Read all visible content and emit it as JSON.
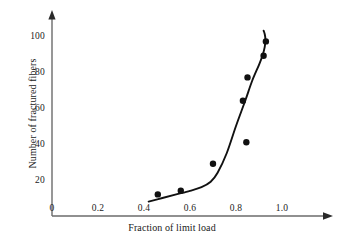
{
  "chart_data": {
    "type": "scatter",
    "title": "",
    "subtitle": "",
    "xlabel": "Fraction of limit load",
    "ylabel": "Number of fractured fibers",
    "xlim": [
      0,
      1.08
    ],
    "ylim": [
      0,
      108
    ],
    "xticks": [
      "0",
      "0.2",
      "0.4",
      "0.6",
      "0.8",
      "1.0"
    ],
    "xtick_values": [
      0,
      0.2,
      0.4,
      0.6,
      0.8,
      1.0
    ],
    "yticks": [
      "20",
      "40",
      "60",
      "80",
      "100"
    ],
    "ytick_values": [
      20,
      40,
      60,
      80,
      100
    ],
    "grid": false,
    "legend": null,
    "axis_style": "arrow-tipped L-axes, no tick marks",
    "marker_style": "filled black circle",
    "marker_color": "#111111",
    "line_color": "#111111",
    "axis_color": "#6b6b6b",
    "points": [
      {
        "x": 0.46,
        "y": 12
      },
      {
        "x": 0.56,
        "y": 14
      },
      {
        "x": 0.7,
        "y": 29
      },
      {
        "x": 0.83,
        "y": 64
      },
      {
        "x": 0.845,
        "y": 41
      },
      {
        "x": 0.85,
        "y": 77
      },
      {
        "x": 0.92,
        "y": 89
      },
      {
        "x": 0.93,
        "y": 97
      }
    ],
    "x": [
      0.46,
      0.56,
      0.7,
      0.83,
      0.845,
      0.85,
      0.92,
      0.93
    ],
    "values": [
      12,
      14,
      29,
      64,
      41,
      77,
      89,
      97
    ],
    "series": [
      {
        "name": "fitted curve",
        "type": "line",
        "x": [
          0.42,
          0.48,
          0.54,
          0.6,
          0.65,
          0.69,
          0.72,
          0.76,
          0.8,
          0.84,
          0.87,
          0.9,
          0.915,
          0.925,
          0.928,
          0.925,
          0.92
        ],
        "values": [
          8,
          10,
          12,
          14,
          16,
          19,
          24,
          35,
          50,
          64,
          75,
          84,
          89,
          94,
          98,
          101,
          103
        ]
      }
    ]
  }
}
